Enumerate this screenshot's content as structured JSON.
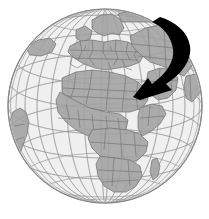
{
  "figure": {
    "title": "Orthographic globe centered on Africa and Europe with black directional arrow",
    "type": "map-illustration",
    "width_px": 209,
    "height_px": 219,
    "background_color": "#ffffff"
  },
  "globe": {
    "name": "world-globe",
    "projection": "orthographic",
    "center_x": 105,
    "center_y": 106,
    "radius_px": 97,
    "ocean_color": "#f0f0f0",
    "land_color": "#ababab",
    "border_color": "#6e6e6e",
    "graticule_color": "#9a9a9a",
    "limb_color": "#8a8a8a",
    "graticule_interval_degrees": 15,
    "center_longitude": 20,
    "center_latitude": 10
  },
  "landmasses": [
    {
      "name": "africa",
      "label": "Africa"
    },
    {
      "name": "europe",
      "label": "Europe"
    },
    {
      "name": "asia",
      "label": "Asia"
    },
    {
      "name": "middle-east",
      "label": "Middle East"
    },
    {
      "name": "arabian-peninsula",
      "label": "Arabian Peninsula"
    },
    {
      "name": "south-america-limb",
      "label": "South America"
    },
    {
      "name": "madagascar",
      "label": "Madagascar"
    },
    {
      "name": "greenland-limb",
      "label": "Greenland"
    }
  ],
  "arrow": {
    "name": "direction-arrow",
    "color": "#000000",
    "shape": "curved-sweep",
    "start_x": 162,
    "start_y": 17,
    "tip_x": 133,
    "tip_y": 97,
    "direction": "down-left",
    "points_to": "Middle East"
  },
  "annotations": {
    "caption": ""
  }
}
